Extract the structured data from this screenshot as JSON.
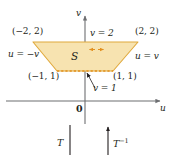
{
  "figure": {
    "colors": {
      "region_fill": "#f7e3b0",
      "region_stroke": "#e0a93c",
      "dashed_edge": "#e2901f",
      "axis": "#6d6e71",
      "text": "#231f20"
    },
    "axes": {
      "horizontal_label": "u",
      "vertical_label": "v",
      "origin_label": "0"
    },
    "region": {
      "label": "S",
      "vertices": [
        {
          "label": "(−2, 2)",
          "u": -2,
          "v": 2
        },
        {
          "label": "(2, 2)",
          "u": 2,
          "v": 2
        },
        {
          "label": "(1, 1)",
          "u": 1,
          "v": 1
        },
        {
          "label": "(−1, 1)",
          "u": -1,
          "v": 1
        }
      ],
      "edges": [
        {
          "label": "v = 2",
          "kind": "top"
        },
        {
          "label": "v = 1",
          "kind": "bottom-dashed"
        },
        {
          "label": "u = −v",
          "kind": "left"
        },
        {
          "label": "u = v",
          "kind": "right"
        }
      ]
    },
    "maps": [
      {
        "label": "T",
        "superscript": "",
        "direction": "down"
      },
      {
        "label": "T",
        "superscript": "−1",
        "direction": "up"
      }
    ]
  }
}
